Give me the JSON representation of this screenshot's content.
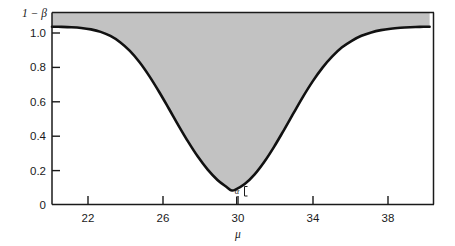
{
  "chart_data": {
    "type": "line",
    "title": "",
    "subtitle": "",
    "xlabel": "μ",
    "ylabel": "1 − β",
    "xlim": [
      20.8,
      40.4
    ],
    "ylim": [
      0,
      1.08
    ],
    "x_ticks": [
      22,
      26,
      30,
      34,
      38
    ],
    "x_tick_labels": [
      "22",
      "26",
      "30",
      "34",
      "38"
    ],
    "y_ticks": [
      0,
      0.2,
      0.4,
      0.6,
      0.8,
      1.0
    ],
    "y_tick_labels": [
      "0",
      "0.2",
      "0.4",
      "0.6",
      "0.8",
      "1.0"
    ],
    "grid": false,
    "legend": "none",
    "curve_name": "power-curve",
    "series": [
      {
        "name": "1 - β (power)",
        "x": [
          20.8,
          21.3,
          21.8,
          22.3,
          22.8,
          23.3,
          23.8,
          24.3,
          24.8,
          25.3,
          25.8,
          26.3,
          26.8,
          27.3,
          27.8,
          28.3,
          28.8,
          29.3,
          29.8,
          30.0,
          30.2,
          30.7,
          31.2,
          31.7,
          32.2,
          32.7,
          33.2,
          33.7,
          34.2,
          34.7,
          35.2,
          35.7,
          36.2,
          36.7,
          37.2,
          37.7,
          38.2,
          38.7,
          39.2,
          39.7,
          40.2
        ],
        "y": [
          1.0,
          0.999,
          0.997,
          0.993,
          0.985,
          0.971,
          0.948,
          0.913,
          0.864,
          0.8,
          0.722,
          0.634,
          0.54,
          0.444,
          0.352,
          0.268,
          0.196,
          0.138,
          0.096,
          0.08,
          0.082,
          0.115,
          0.168,
          0.239,
          0.323,
          0.416,
          0.512,
          0.607,
          0.694,
          0.77,
          0.833,
          0.884,
          0.921,
          0.949,
          0.968,
          0.981,
          0.989,
          0.994,
          0.997,
          0.999,
          1.0
        ]
      }
    ],
    "shaded_region": {
      "name": "beta-region-shading",
      "description": "grey fill between the power curve and the top of the plot frame",
      "color": "#c2c2c2"
    },
    "annotations": [
      {
        "name": "alpha-annotation",
        "text": "α",
        "x": 30,
        "y": 0.04,
        "description": "alpha level bracket at the minimum of the power curve"
      }
    ],
    "colors": {
      "curve": "#111111",
      "shading": "#c2c2c2",
      "axis": "#1a1a1a",
      "background": "#ffffff"
    }
  },
  "axes": {
    "y_axis_title": "1 − β",
    "x_axis_title": "μ",
    "y_labels": [
      "1.0",
      "0.8",
      "0.6",
      "0.4",
      "0.2",
      "0"
    ],
    "x_labels": [
      "22",
      "26",
      "30",
      "34",
      "38"
    ],
    "alpha_symbol": "α"
  }
}
